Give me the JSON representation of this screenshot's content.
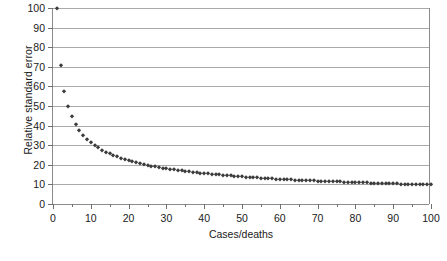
{
  "chart_data": {
    "type": "scatter",
    "title": "",
    "xlabel": "Cases/deaths",
    "ylabel": "Relative standard error",
    "xlim": [
      0,
      100
    ],
    "ylim": [
      0,
      100
    ],
    "xticks": [
      0,
      10,
      20,
      30,
      40,
      50,
      60,
      70,
      80,
      90,
      100
    ],
    "xtick_labels": [
      "0",
      "10",
      "20",
      "30",
      "40",
      "50",
      "60",
      "70",
      "80",
      "90",
      "100"
    ],
    "xminor_ticks": [
      5,
      15,
      25,
      35,
      45,
      55,
      65,
      75,
      85,
      95
    ],
    "yticks": [
      0,
      10,
      20,
      30,
      40,
      50,
      60,
      70,
      80,
      90,
      100
    ],
    "ytick_labels": [
      "0",
      "10",
      "20",
      "30",
      "40",
      "50",
      "60",
      "70",
      "80",
      "90",
      "100"
    ],
    "grid": "horizontal",
    "legend": "none",
    "marker": "diamond",
    "marker_color": "#3b3b3b",
    "formula": "RSE = 100 / sqrt(n)",
    "x": [
      1,
      2,
      3,
      4,
      5,
      6,
      7,
      8,
      9,
      10,
      11,
      12,
      13,
      14,
      15,
      16,
      17,
      18,
      19,
      20,
      21,
      22,
      23,
      24,
      25,
      26,
      27,
      28,
      29,
      30,
      31,
      32,
      33,
      34,
      35,
      36,
      37,
      38,
      39,
      40,
      41,
      42,
      43,
      44,
      45,
      46,
      47,
      48,
      49,
      50,
      51,
      52,
      53,
      54,
      55,
      56,
      57,
      58,
      59,
      60,
      61,
      62,
      63,
      64,
      65,
      66,
      67,
      68,
      69,
      70,
      71,
      72,
      73,
      74,
      75,
      76,
      77,
      78,
      79,
      80,
      81,
      82,
      83,
      84,
      85,
      86,
      87,
      88,
      89,
      90,
      91,
      92,
      93,
      94,
      95,
      96,
      97,
      98,
      99,
      100
    ],
    "y": [
      100,
      70.7,
      57.7,
      50,
      44.7,
      40.8,
      37.8,
      35.4,
      33.3,
      31.6,
      30.2,
      28.9,
      27.7,
      26.7,
      25.8,
      25,
      24.3,
      23.6,
      22.9,
      22.4,
      21.8,
      21.3,
      20.9,
      20.4,
      20,
      19.6,
      19.2,
      18.9,
      18.6,
      18.3,
      18,
      17.7,
      17.4,
      17.1,
      16.9,
      16.7,
      16.4,
      16.2,
      16,
      15.8,
      15.6,
      15.4,
      15.2,
      15.1,
      14.9,
      14.7,
      14.6,
      14.4,
      14.3,
      14.1,
      14,
      13.9,
      13.7,
      13.6,
      13.5,
      13.4,
      13.2,
      13.1,
      13,
      12.9,
      12.8,
      12.7,
      12.6,
      12.5,
      12.4,
      12.3,
      12.2,
      12.1,
      12,
      11.9,
      11.9,
      11.8,
      11.7,
      11.6,
      11.5,
      11.5,
      11.4,
      11.3,
      11.2,
      11.2,
      11.1,
      11,
      11,
      10.9,
      10.8,
      10.8,
      10.7,
      10.7,
      10.6,
      10.5,
      10.5,
      10.4,
      10.4,
      10.3,
      10.3,
      10.2,
      10.2,
      10.1,
      10.1,
      10
    ]
  },
  "caption": {
    "text": "",
    "visible": false
  }
}
